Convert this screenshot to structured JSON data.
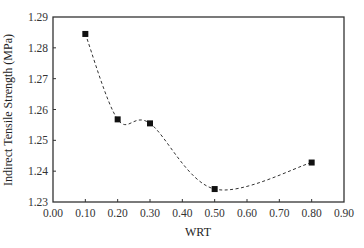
{
  "chart_data": {
    "type": "line",
    "title": "",
    "xlabel": "WRT",
    "ylabel": "Indirect Tensile Strength (MPa)",
    "xlim": [
      0.0,
      0.9
    ],
    "ylim": [
      1.23,
      1.29
    ],
    "x_ticks": [
      "0.00",
      "0.10",
      "0.20",
      "0.30",
      "0.40",
      "0.50",
      "0.60",
      "0.70",
      "0.80",
      "0.90"
    ],
    "y_ticks": [
      "1.23",
      "1.24",
      "1.25",
      "1.26",
      "1.27",
      "1.28",
      "1.29"
    ],
    "grid": false,
    "legend": null,
    "series": [
      {
        "name": "Indirect Tensile Strength",
        "marker": "square",
        "line_style": "dashed smooth",
        "x": [
          0.1,
          0.2,
          0.3,
          0.5,
          0.8
        ],
        "values": [
          1.2845,
          1.2568,
          1.2555,
          1.2342,
          1.2428
        ]
      }
    ]
  },
  "colors": {
    "axis": "#333333",
    "marker": "#111111",
    "line": "#333333",
    "background": "#ffffff"
  }
}
